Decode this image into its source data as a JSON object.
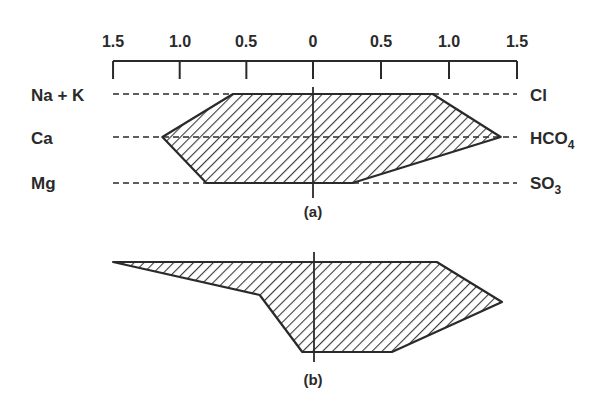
{
  "figure": {
    "type": "Stiff diagram",
    "scale": {
      "tick_labels_left": [
        "1.5",
        "1.0",
        "0.5",
        "0"
      ],
      "tick_labels_right": [
        "0.5",
        "1.0",
        "1.5"
      ],
      "ticks": [
        -1.5,
        -1.0,
        -0.5,
        0,
        0.5,
        1.0,
        1.5
      ]
    },
    "cation_labels": [
      "Na + K",
      "Ca",
      "Mg"
    ],
    "anion_labels": [
      {
        "base": "Cl",
        "sub": ""
      },
      {
        "base": "HCO",
        "sub": "4"
      },
      {
        "base": "SO",
        "sub": "3"
      }
    ],
    "panel_labels": [
      "(a)",
      "(b)"
    ],
    "colors": {
      "ink": "#2a2a2a",
      "hatch": "#3a3a3a",
      "background": "#ffffff"
    }
  },
  "chart_data": {
    "type": "stiff",
    "title": "",
    "x_axis": {
      "range": [
        -1.5,
        1.5
      ],
      "ticks": [
        1.5,
        1.0,
        0.5,
        0,
        0.5,
        1.0,
        1.5
      ],
      "note": "cations plotted left of zero, anions right"
    },
    "rows": [
      {
        "cation": "Na + K",
        "anion": "Cl"
      },
      {
        "cation": "Ca",
        "anion": "HCO4"
      },
      {
        "cation": "Mg",
        "anion": "SO3"
      }
    ],
    "series": [
      {
        "name": "(a)",
        "cations": {
          "Na + K": 0.6,
          "Ca": 1.13,
          "Mg": 0.8
        },
        "anions": {
          "Cl": 0.88,
          "HCO4": 1.38,
          "SO3": 0.29
        }
      },
      {
        "name": "(b)",
        "cations": {
          "Na + K": 1.5,
          "Ca": 0.4,
          "Mg": 0.08
        },
        "anions": {
          "Cl": 0.91,
          "HCO4": 1.39,
          "SO3": 0.58
        }
      }
    ],
    "legend": "none",
    "grid": false
  }
}
